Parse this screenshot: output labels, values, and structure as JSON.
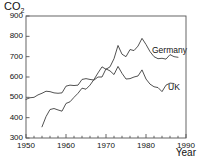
{
  "chart_data": {
    "type": "line",
    "title": "",
    "ylabel": "CO",
    "ylabel_sub": "2",
    "xlabel": "Year",
    "xlim": [
      1950,
      1990
    ],
    "ylim": [
      300,
      900
    ],
    "yticks": [
      300,
      400,
      500,
      600,
      700,
      800,
      900
    ],
    "xticks": [
      1950,
      1960,
      1970,
      1980,
      1990
    ],
    "xminor_step": 2,
    "grid": false,
    "legend_position": "inline-right",
    "series": [
      {
        "name": "Germany",
        "label": "Germany",
        "label_x": 1981.5,
        "label_y": 735,
        "x": [
          1954,
          1955,
          1956,
          1957,
          1958,
          1959,
          1960,
          1961,
          1962,
          1963,
          1964,
          1965,
          1966,
          1967,
          1968,
          1969,
          1970,
          1971,
          1972,
          1973,
          1974,
          1975,
          1976,
          1977,
          1978,
          1979,
          1980,
          1981,
          1982,
          1983,
          1984,
          1985,
          1986,
          1987,
          1988
        ],
        "y": [
          355,
          405,
          440,
          445,
          438,
          432,
          470,
          478,
          500,
          520,
          545,
          540,
          560,
          588,
          620,
          650,
          638,
          650,
          690,
          755,
          712,
          700,
          735,
          730,
          752,
          790,
          760,
          725,
          700,
          690,
          692,
          688,
          710,
          700,
          697
        ]
      },
      {
        "name": "UK",
        "label": "UK",
        "label_x": 1985.5,
        "label_y": 552,
        "x": [
          1950,
          1951,
          1952,
          1953,
          1954,
          1955,
          1956,
          1957,
          1958,
          1959,
          1960,
          1961,
          1962,
          1963,
          1964,
          1965,
          1966,
          1967,
          1968,
          1969,
          1970,
          1971,
          1972,
          1973,
          1974,
          1975,
          1976,
          1977,
          1978,
          1979,
          1980,
          1981,
          1982,
          1983,
          1984,
          1985,
          1986,
          1987
        ],
        "y": [
          490,
          498,
          500,
          512,
          520,
          530,
          528,
          522,
          520,
          522,
          555,
          560,
          558,
          560,
          588,
          592,
          588,
          585,
          600,
          600,
          640,
          630,
          612,
          652,
          618,
          590,
          592,
          600,
          605,
          635,
          590,
          565,
          552,
          548,
          528,
          560,
          570,
          568
        ]
      }
    ]
  }
}
